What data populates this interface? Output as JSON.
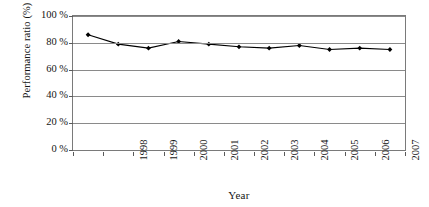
{
  "chart_data": {
    "type": "line",
    "title": "",
    "subtitle": "",
    "xlabel": "Year",
    "ylabel": "Performance ratio (%)",
    "categories": [
      "1998",
      "1999",
      "2000",
      "2001",
      "2002",
      "2003",
      "2004",
      "2005",
      "2006",
      "2007",
      "2008"
    ],
    "values": [
      86,
      79,
      76,
      81,
      79,
      77,
      76,
      78,
      75,
      76,
      75
    ],
    "series": [
      {
        "name": "Performance ratio",
        "values": [
          86,
          79,
          76,
          81,
          79,
          77,
          76,
          78,
          75,
          76,
          75
        ],
        "line_color": "#000000",
        "marker": "diamond",
        "marker_color": "#000000"
      }
    ],
    "ylim": [
      0,
      100
    ],
    "y_ticks": [
      0,
      20,
      40,
      60,
      80,
      100
    ],
    "y_tick_labels": [
      "0 %",
      "20 %",
      "40 %",
      "60 %",
      "80 %",
      "100 %"
    ],
    "x_tick_labels_rotation_deg": 90,
    "grid": "horizontal",
    "grid_color": "#8a8a8a",
    "legend": "none",
    "plot_background": "#ffffff",
    "frame_color": "#7a7a7a",
    "annotations": []
  }
}
